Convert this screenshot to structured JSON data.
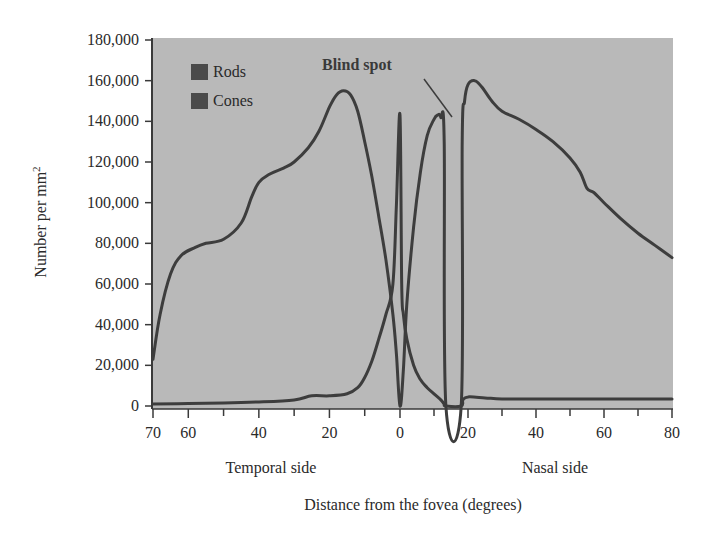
{
  "chart_data": {
    "type": "line",
    "title": "",
    "xlabel": "Distance from the fovea (degrees)",
    "ylabel": "Number per mm²",
    "ylabel_base": "Number per mm",
    "ylabel_sup": "2",
    "x_side_labels": {
      "temporal": "Temporal side",
      "nasal": "Nasal side"
    },
    "x_tick_labels": [
      "70",
      "60",
      "40",
      "20",
      "0",
      "20",
      "40",
      "60",
      "80"
    ],
    "x_tick_values": [
      -70,
      -60,
      -40,
      -20,
      0,
      20,
      40,
      60,
      80
    ],
    "x_minor_ticks": [
      -50,
      -30,
      -10,
      10,
      30,
      50,
      70
    ],
    "xlim": [
      -70,
      80
    ],
    "y_tick_labels": [
      "0",
      "20,000",
      "40,000",
      "60,000",
      "80,000",
      "100,000",
      "120,000",
      "140,000",
      "160,000",
      "180,000"
    ],
    "y_tick_values": [
      0,
      20000,
      40000,
      60000,
      80000,
      100000,
      120000,
      140000,
      160000,
      180000
    ],
    "ylim": [
      0,
      180000
    ],
    "grid": false,
    "legend": {
      "position": "upper-left",
      "entries": [
        "Rods",
        "Cones"
      ]
    },
    "annotations": [
      {
        "text": "Blind spot",
        "x": 16,
        "y": 160000
      }
    ],
    "blind_spot_range_deg": [
      13,
      18
    ],
    "series": [
      {
        "name": "Rods",
        "x": [
          -70,
          -68,
          -65,
          -62,
          -58,
          -55,
          -50,
          -45,
          -42,
          -40,
          -37,
          -33,
          -30,
          -26,
          -23,
          -20,
          -18,
          -16,
          -14,
          -12,
          -10,
          -8,
          -6,
          -4,
          -2,
          -1,
          0,
          1,
          2,
          4,
          6,
          8,
          10,
          11,
          12,
          13,
          13.5,
          18,
          18.3,
          19,
          20,
          22,
          24,
          27,
          30,
          35,
          40,
          45,
          50,
          53,
          55,
          57,
          60,
          65,
          70,
          75,
          80
        ],
        "values": [
          23000,
          45000,
          65000,
          74000,
          78000,
          80000,
          82000,
          90000,
          103000,
          110000,
          114000,
          117000,
          120000,
          127000,
          135000,
          147000,
          153000,
          155000,
          153000,
          145000,
          130000,
          113000,
          93000,
          72000,
          45000,
          25000,
          0,
          18000,
          50000,
          88000,
          115000,
          133000,
          141000,
          143000,
          142000,
          130000,
          0,
          0,
          130000,
          150000,
          158000,
          160000,
          157000,
          150000,
          145000,
          141000,
          136000,
          130000,
          122000,
          115000,
          107000,
          105000,
          100000,
          92000,
          85000,
          79000,
          73000
        ]
      },
      {
        "name": "Cones",
        "x": [
          -70,
          -60,
          -50,
          -40,
          -30,
          -25,
          -20,
          -15,
          -12,
          -10,
          -8,
          -6,
          -4,
          -2,
          -1,
          0,
          0.5,
          1,
          2,
          4,
          6,
          8,
          10,
          12,
          13,
          13.5,
          18,
          18.5,
          20,
          25,
          30,
          40,
          50,
          60,
          70,
          80
        ],
        "values": [
          1000,
          1200,
          1500,
          2000,
          3000,
          5000,
          5000,
          6000,
          9000,
          14000,
          22000,
          33000,
          45000,
          60000,
          100000,
          143000,
          60000,
          45000,
          33000,
          20000,
          13000,
          9000,
          6000,
          3000,
          1000,
          0,
          0,
          3000,
          4500,
          4000,
          3500,
          3500,
          3500,
          3500,
          3500,
          3500
        ]
      }
    ]
  },
  "colors": {
    "plot_background": "#b9b9b9",
    "curve": "#3d3d3d",
    "axis": "#3a3a3a",
    "legend_swatch": "#4a4a4a",
    "page_background": "#ffffff"
  }
}
